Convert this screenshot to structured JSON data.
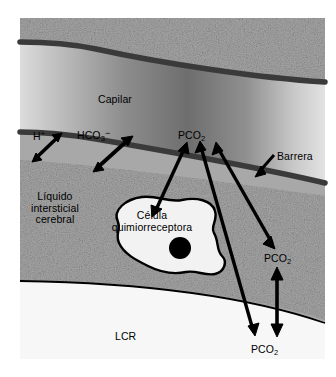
{
  "figure": {
    "kind": "anatomical-diagram",
    "language": "es"
  },
  "regions": [
    {
      "id": "brain-tissue-top",
      "name": "tejido-cerebral-superior",
      "fill": "#a8a8a8",
      "texture": "speckle"
    },
    {
      "id": "capillary",
      "name": "capilar",
      "fill_gradient": [
        "#d8d8d8",
        "#707070",
        "#d8d8d8"
      ]
    },
    {
      "id": "interstitial-fluid",
      "name": "liquido-intersticial",
      "fill": "#a8a8a8",
      "texture": "speckle"
    },
    {
      "id": "csf",
      "name": "lcr",
      "fill": "#f7f7f7"
    }
  ],
  "labels": {
    "capilar": "Capilar",
    "barrera": "Barrera",
    "h_plus": "H",
    "h_plus_sup": "+",
    "hco3": "HCO",
    "hco3_sub": "3",
    "hco3_sup": "−",
    "pco2_capillary": "PCO",
    "pco2_capillary_sub": "2",
    "pco2_interstitial": "PCO",
    "pco2_interstitial_sub": "2",
    "pco2_csf": "PCO",
    "pco2_csf_sub": "2",
    "liquido_l1": "Líquido",
    "liquido_l2": "intersticial",
    "liquido_l3": "cerebral",
    "celula_l1": "Célula",
    "celula_l2": "quimiorreceptora",
    "lcr": "LCR"
  },
  "colors": {
    "ink": "#000000",
    "membrane": "#3a3a3a",
    "tissue": "#a8a8a8",
    "csf": "#f7f7f7",
    "nucleus": "#000000",
    "cell_fill": "#f2f2f2"
  },
  "arrows": [
    {
      "name": "h-plus-exchange",
      "double_headed": true,
      "note": "H+ cruza la barrera"
    },
    {
      "name": "hco3-exchange",
      "double_headed": true,
      "note": "HCO3- cruza la barrera"
    },
    {
      "name": "pco2-cell-to-capillary",
      "double_headed": true,
      "note": "PCO2 entre célula quimiorreceptora y capilar"
    },
    {
      "name": "pco2-csf-to-capillary",
      "double_headed": true,
      "note": "PCO2 entre LCR y capilar"
    },
    {
      "name": "pco2-interstitial-to-capillary",
      "double_headed": true,
      "note": "PCO2 entre líquido intersticial y capilar"
    },
    {
      "name": "pco2-csf-to-interstitial",
      "double_headed": true,
      "note": "PCO2 entre LCR y líquido intersticial"
    },
    {
      "name": "barrera-pointer",
      "double_headed": false,
      "note": "señala la barrera hematoencefálica"
    }
  ]
}
